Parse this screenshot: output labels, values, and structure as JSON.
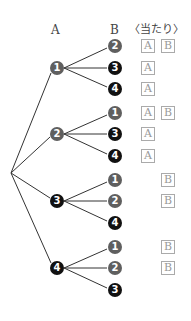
{
  "header": {
    "col_a": "A",
    "col_b": "B",
    "col_win": "〈当たり〉"
  },
  "colors": {
    "gray_node": "#5f5f5f",
    "black_node": "#111111",
    "box_border": "#aaaaaa",
    "line": "#333333"
  },
  "tree": [
    {
      "a": "1",
      "children": [
        {
          "b": "2",
          "win": [
            "A",
            "B"
          ]
        },
        {
          "b": "3",
          "win": [
            "A"
          ]
        },
        {
          "b": "4",
          "win": [
            "A"
          ]
        }
      ]
    },
    {
      "a": "2",
      "children": [
        {
          "b": "1",
          "win": [
            "A",
            "B"
          ]
        },
        {
          "b": "3",
          "win": [
            "A"
          ]
        },
        {
          "b": "4",
          "win": [
            "A"
          ]
        }
      ]
    },
    {
      "a": "3",
      "children": [
        {
          "b": "1",
          "win": [
            "B"
          ]
        },
        {
          "b": "2",
          "win": [
            "B"
          ]
        },
        {
          "b": "4",
          "win": []
        }
      ]
    },
    {
      "a": "4",
      "children": [
        {
          "b": "1",
          "win": [
            "B"
          ]
        },
        {
          "b": "2",
          "win": [
            "B"
          ]
        },
        {
          "b": "3",
          "win": []
        }
      ]
    }
  ]
}
